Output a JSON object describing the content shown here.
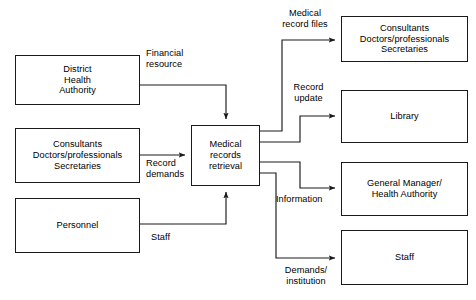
{
  "diagram": {
    "stroke_color": "#1a1a1a",
    "background_color": "#ffffff",
    "text_color": "#000000",
    "nodes": [
      {
        "id": "district-health-authority",
        "label": "District\nHealth\nAuthority",
        "x": 15,
        "y": 55,
        "w": 125,
        "h": 50
      },
      {
        "id": "consultants-source",
        "label": "Consultants\nDoctors/professionals\nSecretaries",
        "x": 15,
        "y": 128,
        "w": 125,
        "h": 55
      },
      {
        "id": "personnel",
        "label": "Personnel",
        "x": 15,
        "y": 198,
        "w": 125,
        "h": 55
      },
      {
        "id": "medical-records-retrieval",
        "label": "Medical\nrecords\nretrieval",
        "x": 191,
        "y": 125,
        "w": 69,
        "h": 61
      },
      {
        "id": "consultants-target",
        "label": "Consultants\nDoctors/professionals\nSecretaries",
        "x": 341,
        "y": 16,
        "w": 127,
        "h": 46
      },
      {
        "id": "library",
        "label": "Library",
        "x": 341,
        "y": 90,
        "w": 127,
        "h": 53
      },
      {
        "id": "general-manager",
        "label": "General Manager/\nHealth Authority",
        "x": 341,
        "y": 162,
        "w": 127,
        "h": 54
      },
      {
        "id": "staff-target",
        "label": "Staff",
        "x": 341,
        "y": 230,
        "w": 127,
        "h": 55
      }
    ],
    "flow_labels": [
      {
        "id": "financial-resource",
        "text": "Financial\nresource",
        "x": 146,
        "y": 48,
        "align": "left"
      },
      {
        "id": "record-demands",
        "text": "Record\ndemands",
        "x": 146,
        "y": 158,
        "align": "left"
      },
      {
        "id": "staff-input",
        "text": "Staff",
        "x": 151,
        "y": 232,
        "align": "left"
      },
      {
        "id": "medical-record-files",
        "text": "Medical\nrecord files",
        "x": 275,
        "y": 8,
        "align": "center"
      },
      {
        "id": "record-update",
        "text": "Record\nupdate",
        "x": 285,
        "y": 82,
        "align": "center"
      },
      {
        "id": "information",
        "text": "Information",
        "x": 276,
        "y": 194,
        "align": "left"
      },
      {
        "id": "demands-institution",
        "text": "Demands/\ninstitution",
        "x": 280,
        "y": 265,
        "align": "center"
      }
    ],
    "connections": [
      {
        "id": "district-to-retrieval",
        "from": "district-health-authority",
        "to": "medical-records-retrieval",
        "label": "Financial resource"
      },
      {
        "id": "consultants-to-retrieval",
        "from": "consultants-source",
        "to": "medical-records-retrieval",
        "label": "Record demands"
      },
      {
        "id": "personnel-to-retrieval",
        "from": "personnel",
        "to": "medical-records-retrieval",
        "label": "Staff"
      },
      {
        "id": "retrieval-to-consultants",
        "from": "medical-records-retrieval",
        "to": "consultants-target",
        "label": "Medical record files"
      },
      {
        "id": "retrieval-to-library",
        "from": "medical-records-retrieval",
        "to": "library",
        "label": "Record update"
      },
      {
        "id": "retrieval-to-general-manager",
        "from": "medical-records-retrieval",
        "to": "general-manager",
        "label": "Information"
      },
      {
        "id": "retrieval-to-staff",
        "from": "medical-records-retrieval",
        "to": "staff-target",
        "label": "Demands/institution"
      }
    ]
  }
}
